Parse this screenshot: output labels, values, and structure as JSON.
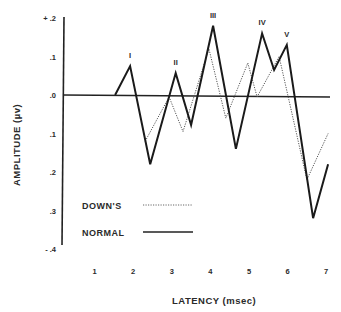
{
  "chart_data": {
    "type": "line",
    "title": "",
    "xlabel": "LATENCY (msec)",
    "ylabel": "AMPLITUDE (µv)",
    "xlim": [
      0.6,
      7.2
    ],
    "ylim": [
      -0.4,
      0.2
    ],
    "x_ticks": [
      "1",
      "2",
      "3",
      "4",
      "5",
      "6",
      "7"
    ],
    "y_ticks": [
      "+ .2",
      ".1",
      ".0",
      ".1",
      ".2",
      ".3",
      "- .4"
    ],
    "y_tick_values": [
      0.2,
      0.1,
      0.0,
      -0.1,
      -0.2,
      -0.3,
      -0.4
    ],
    "grid": false,
    "baseline": 0.0,
    "legend_position": "lower-left",
    "peak_labels": [
      {
        "label": "I",
        "x": 1.92,
        "y": 0.075
      },
      {
        "label": "II",
        "x": 3.1,
        "y": 0.057
      },
      {
        "label": "III",
        "x": 4.07,
        "y": 0.18
      },
      {
        "label": "IV",
        "x": 5.34,
        "y": 0.16
      },
      {
        "label": "V",
        "x": 5.98,
        "y": 0.13
      }
    ],
    "series": [
      {
        "name": "NORMAL",
        "style": "solid",
        "color": "#1a1a1a",
        "x": [
          1.53,
          1.92,
          2.44,
          3.1,
          3.5,
          4.07,
          4.66,
          5.34,
          5.65,
          5.98,
          6.66,
          7.05
        ],
        "y": [
          0.0,
          0.075,
          -0.18,
          0.057,
          -0.078,
          0.18,
          -0.14,
          0.16,
          0.065,
          0.13,
          -0.32,
          -0.18
        ]
      },
      {
        "name": "DOWN'S",
        "style": "dotted",
        "color": "#555555",
        "x": [
          2.31,
          2.93,
          3.29,
          3.96,
          4.4,
          4.97,
          5.21,
          5.78,
          6.5,
          7.05
        ],
        "y": [
          -0.12,
          -0.005,
          -0.095,
          0.12,
          -0.06,
          0.083,
          -0.005,
          0.1,
          -0.22,
          -0.1
        ]
      }
    ]
  },
  "legend": {
    "downs_label": "DOWN'S",
    "normal_label": "NORMAL"
  },
  "axes": {
    "xlabel": "LATENCY  (msec)",
    "ylabel": "AMPLITUDE  (µv)"
  }
}
